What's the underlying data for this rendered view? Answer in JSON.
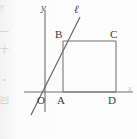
{
  "figure": {
    "kind": "coordinate-geometry-diagram",
    "background_color": "#fbfbfa",
    "stroke_color": "#6f6f6f",
    "label_color": "#3a3a3a",
    "width": 137,
    "height": 139,
    "axes": {
      "y_axis_label": "y",
      "x_axis_label": "x",
      "origin_label": "O",
      "y_axis_x": 45,
      "y_axis_top": 10,
      "y_axis_bottom": 112,
      "x_axis_y": 92,
      "x_axis_left": 24,
      "x_axis_right": 133
    },
    "line": {
      "label": "ℓ",
      "x1": 31,
      "y1": 115,
      "x2": 80,
      "y2": 17
    },
    "rectangle": {
      "name": "ABCD",
      "left": 63,
      "right": 116,
      "top": 41,
      "bottom": 92
    },
    "points": [
      {
        "label": "B",
        "x": 63,
        "y": 41,
        "label_x": 55,
        "label_y": 29
      },
      {
        "label": "C",
        "x": 116,
        "y": 41,
        "label_x": 110,
        "label_y": 29
      },
      {
        "label": "A",
        "x": 63,
        "y": 92,
        "label_x": 57,
        "label_y": 95
      },
      {
        "label": "D",
        "x": 116,
        "y": 92,
        "label_x": 108,
        "label_y": 95
      },
      {
        "label": "O",
        "x": 45,
        "y": 92,
        "label_x": 37,
        "label_y": 95
      }
    ],
    "margin_fragments": [
      {
        "text": "y",
        "top": 2
      },
      {
        "text": "一",
        "top": 28
      },
      {
        "text": "于",
        "top": 45
      },
      {
        "text": "・",
        "top": 76
      },
      {
        "text": "回",
        "top": 96
      }
    ]
  }
}
